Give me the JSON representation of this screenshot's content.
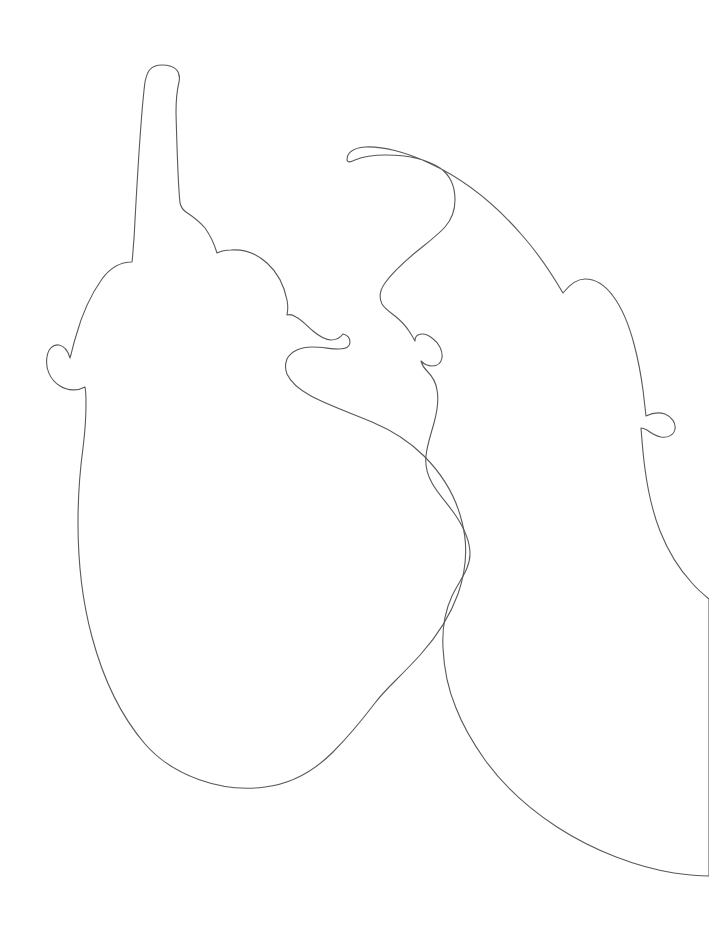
{
  "document": {
    "title": "Eggplant Outline Drawing",
    "type": "line-drawing",
    "width": 709,
    "height": 928,
    "background_color": "#ffffff",
    "stroke_color": "#595959",
    "stroke_width": 1.1
  },
  "drawing": {
    "description": "Minimal single-weight contour line drawing of two eggplants (aubergines), one upright on the left and one tilted on the right, their outlines overlapping and crossing in the lower middle of the frame.",
    "subject_count": 2,
    "subjects": [
      {
        "name": "left-eggplant",
        "label": "Left eggplant",
        "orientation": "upright",
        "stem_tip": {
          "x": 162,
          "y": 65
        },
        "bottom": {
          "x": 300,
          "y": 776
        },
        "left_extent_x": 78,
        "right_extent_x": 410,
        "parts": [
          "stem",
          "calyx-left-sepal",
          "calyx-right-sepal",
          "body"
        ]
      },
      {
        "name": "right-eggplant",
        "label": "Right eggplant",
        "orientation": "tilted-right",
        "stem_tip": {
          "x": 347,
          "y": 160
        },
        "bottom": {
          "x": 709,
          "y": 876
        },
        "left_extent_x": 283,
        "right_extent_x": 709,
        "parts": [
          "stem",
          "calyx-left-sepal",
          "calyx-right-sepal",
          "body"
        ]
      }
    ],
    "crossings": [
      {
        "name": "upper-crossing",
        "x": 418,
        "y": 516
      },
      {
        "name": "lower-crossing",
        "x": 418,
        "y": 729
      }
    ],
    "paths": {
      "left_eggplant": "M 162,65 C 150,65 147,72 145,82 C 141,112 137,182 134,239 C 133,248 133,255 132,262 C 121,262 110,268 102,279 C 92,293 82,314 76,336 C 73,345 72,352 70,358 C 68,351 64,346 59,345 C 53,344 48,349 47,357 C 45,368 50,380 60,386 C 68,391 78,391 85,387 C 86,392 86,398 86,404 C 86,416 85,432 83,448 C 80,470 78,497 78,523 C 78,560 82,600 92,637 C 103,678 121,716 145,744 C 173,776 222,793 265,787 C 290,784 314,771 333,752 C 348,737 362,720 375,703 C 381,695 388,688 395,681 C 404,672 413,663 421,654 C 437,636 450,616 458,594 C 466,571 468,545 462,522 C 456,497 442,474 424,456 C 409,441 391,430 372,422 C 351,413 330,406 311,396 C 300,390 291,383 287,374 C 285,369 285,364 287,359 C 291,351 301,347 312,347 C 322,347 331,349 339,349 C 345,349 350,347 350,342 C 350,338 347,335 343,334 C 340,338 336,340 331,340 C 325,340 319,336 313,331 C 307,326 302,320 296,317 C 293,315 290,314 287,315 C 288,310 288,305 287,300 C 284,285 277,272 267,263 C 257,254 244,249 231,250 C 226,250 221,251 217,253 C 214,243 210,235 205,228 C 199,221 192,216 186,212 C 183,210 181,207 180,203 C 178,185 177,150 176,113 C 176,100 177,90 179,82 C 181,72 176,65 162,65 Z",
      "right_eggplant": "M 347,160 C 347,152 354,148 365,147 C 382,146 406,152 429,163 C 462,178 494,203 521,234 C 539,254 553,276 563,293 C 570,284 577,279 585,279 C 595,279 605,285 613,296 C 622,308 629,325 634,344 C 638,359 641,375 643,390 C 644,399 645,408 646,416 C 652,413 659,412 665,414 C 672,417 676,423 675,429 C 674,435 668,438 661,437 C 656,436 651,433 647,430 C 645,429 643,428 641,428 C 642,441 643,455 645,469 C 648,492 653,513 660,531 C 668,551 679,569 692,583 C 697,589 703,594 709,599 L 709,876 C 700,876 688,875 674,873 C 637,867 594,851 557,827 C 528,808 503,785 485,760 C 473,743 463,726 456,708 C 448,689 444,669 443,648 C 442,629 445,611 452,596 C 459,581 470,569 470,554 C 470,541 464,528 456,516 C 448,504 438,494 432,483 C 427,474 425,465 426,456 C 427,445 431,434 434,423 C 437,412 439,400 437,390 C 436,382 432,376 427,371 C 424,368 422,365 421,361 C 424,364 428,366 432,366 C 437,366 441,363 442,358 C 443,351 439,343 432,338 C 427,334 422,333 418,335 C 416,336 415,338 415,341 C 413,337 411,334 409,331 C 405,325 400,320 395,316 C 390,312 385,309 382,304 C 379,298 380,290 385,283 C 392,273 404,262 416,252 C 427,243 438,235 445,227 C 452,219 455,210 455,200 C 455,187 450,175 440,168 C 426,159 405,155 386,155 C 374,155 362,157 355,160 C 351,162 348,163 347,160 Z"
    }
  },
  "accessibility": {
    "alt_text": "A minimalist black line drawing on a white background showing the contour outlines of two eggplants whose shapes overlap and intersect."
  }
}
